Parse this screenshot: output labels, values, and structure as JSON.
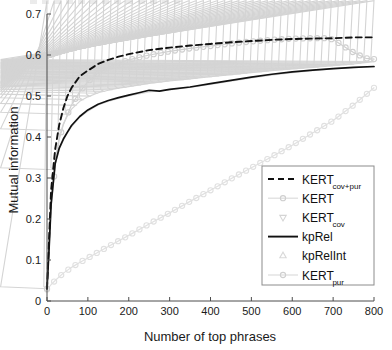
{
  "chart_data": {
    "type": "line",
    "title": "",
    "xlabel": "Number of top phrases",
    "ylabel": "Mutual information",
    "xlim": [
      0,
      800
    ],
    "ylim": [
      0,
      0.7
    ],
    "xticks": [
      0,
      100,
      200,
      300,
      400,
      500,
      600,
      700,
      800
    ],
    "yticks": [
      0,
      0.1,
      0.2,
      0.3,
      0.4,
      0.5,
      0.6,
      0.7
    ],
    "xtick_labels": [
      "0",
      "100",
      "200",
      "300",
      "400",
      "500",
      "600",
      "700",
      "800"
    ],
    "ytick_labels": [
      "0",
      "0.1",
      "0.2",
      "0.3",
      "0.4",
      "0.5",
      "0.6",
      "0.7"
    ],
    "grid": false,
    "legend_position": "lower right",
    "series": [
      {
        "name": "KERT_cov+pur",
        "label_base": "KERT",
        "label_sub": "cov+pur",
        "style": "dashed",
        "marker": "none",
        "color": "#111111",
        "x": [
          0,
          5,
          10,
          20,
          30,
          40,
          50,
          60,
          80,
          100,
          125,
          150,
          175,
          200,
          250,
          300,
          350,
          400,
          450,
          500,
          550,
          600,
          650,
          700,
          750,
          800
        ],
        "y": [
          0.03,
          0.15,
          0.27,
          0.37,
          0.43,
          0.47,
          0.5,
          0.52,
          0.548,
          0.562,
          0.578,
          0.588,
          0.596,
          0.602,
          0.612,
          0.618,
          0.623,
          0.627,
          0.631,
          0.634,
          0.637,
          0.639,
          0.64,
          0.641,
          0.643,
          0.643
        ]
      },
      {
        "name": "KERT",
        "label_base": "KERT",
        "label_sub": "",
        "style": "solid",
        "marker": "circle",
        "color": "#cfcfcf",
        "x": [
          0,
          5,
          10,
          20,
          30,
          40,
          50,
          60,
          80,
          100,
          125,
          150,
          175,
          200,
          250,
          300,
          350,
          400,
          450,
          500,
          550,
          600,
          650,
          680,
          700,
          720,
          750,
          780,
          800
        ],
        "y": [
          0.03,
          0.12,
          0.23,
          0.33,
          0.395,
          0.43,
          0.455,
          0.478,
          0.51,
          0.535,
          0.556,
          0.57,
          0.58,
          0.588,
          0.6,
          0.609,
          0.616,
          0.622,
          0.628,
          0.633,
          0.637,
          0.64,
          0.641,
          0.641,
          0.638,
          0.625,
          0.606,
          0.592,
          0.59
        ]
      },
      {
        "name": "KERT_cov",
        "label_base": "KERT",
        "label_sub": "cov",
        "style": "solid",
        "marker": "triangle-down",
        "color": "#d4d4d4",
        "x": [
          0,
          5,
          10,
          20,
          30,
          40,
          50,
          60,
          80,
          100,
          125,
          150,
          175,
          200,
          250,
          300,
          350,
          400,
          450,
          500,
          550,
          600,
          650,
          700,
          750,
          800
        ],
        "y": [
          0.03,
          0.14,
          0.25,
          0.345,
          0.4,
          0.432,
          0.452,
          0.468,
          0.487,
          0.498,
          0.508,
          0.514,
          0.519,
          0.523,
          0.531,
          0.537,
          0.542,
          0.547,
          0.552,
          0.557,
          0.562,
          0.566,
          0.57,
          0.574,
          0.578,
          0.584
        ]
      },
      {
        "name": "kpRel",
        "label_base": "kpRel",
        "label_sub": "",
        "style": "solid",
        "marker": "none",
        "color": "#111111",
        "x": [
          0,
          5,
          10,
          20,
          30,
          40,
          50,
          60,
          80,
          100,
          125,
          150,
          175,
          200,
          225,
          250,
          275,
          300,
          350,
          400,
          450,
          500,
          550,
          600,
          650,
          700,
          750,
          800
        ],
        "y": [
          0.03,
          0.125,
          0.235,
          0.335,
          0.373,
          0.395,
          0.412,
          0.428,
          0.45,
          0.466,
          0.48,
          0.489,
          0.496,
          0.502,
          0.508,
          0.514,
          0.512,
          0.516,
          0.522,
          0.53,
          0.538,
          0.546,
          0.553,
          0.559,
          0.563,
          0.567,
          0.57,
          0.572
        ]
      },
      {
        "name": "kpRelInt",
        "label_base": "kpRelInt",
        "label_sub": "",
        "style": "solid",
        "marker": "triangle-up",
        "color": "#d9d9d9",
        "x": [
          0,
          5,
          10,
          20,
          30,
          40,
          50,
          60,
          80,
          100,
          125,
          150,
          175,
          200,
          250,
          300,
          350,
          400,
          450,
          500,
          550,
          600,
          650,
          700,
          750,
          800
        ],
        "y": [
          0.03,
          0.125,
          0.235,
          0.333,
          0.37,
          0.392,
          0.41,
          0.425,
          0.448,
          0.463,
          0.478,
          0.487,
          0.494,
          0.5,
          0.51,
          0.515,
          0.521,
          0.528,
          0.536,
          0.544,
          0.551,
          0.557,
          0.562,
          0.566,
          0.569,
          0.571
        ]
      },
      {
        "name": "KERT_pur",
        "label_base": "KERT",
        "label_sub": "pur",
        "style": "solid",
        "marker": "circle",
        "color": "#e0e0e0",
        "x": [
          0,
          10,
          20,
          40,
          60,
          80,
          100,
          150,
          200,
          250,
          300,
          350,
          400,
          450,
          500,
          550,
          600,
          650,
          700,
          750,
          800
        ],
        "y": [
          0.028,
          0.04,
          0.05,
          0.068,
          0.082,
          0.094,
          0.105,
          0.133,
          0.16,
          0.188,
          0.215,
          0.243,
          0.27,
          0.298,
          0.325,
          0.352,
          0.38,
          0.41,
          0.44,
          0.478,
          0.52
        ]
      }
    ]
  },
  "axes": {
    "ylabel": "Mutual information",
    "xlabel": "Number of top phrases"
  },
  "legend": {
    "items": [
      {
        "base": "KERT",
        "sub": "cov+pur",
        "sample": "dashed-line"
      },
      {
        "base": "KERT",
        "sub": "",
        "sample": "circle-line"
      },
      {
        "base": "KERT",
        "sub": "cov",
        "sample": "triangle-down-line"
      },
      {
        "base": "kpRel",
        "sub": "",
        "sample": "solid-line"
      },
      {
        "base": "kpRelInt",
        "sub": "",
        "sample": "triangle-up-line"
      },
      {
        "base": "KERT",
        "sub": "pur",
        "sample": "circle-line"
      }
    ]
  },
  "colors": {
    "axis": "#4d4d4d",
    "text": "#1a1a1a",
    "dark_series": "#111111",
    "light_series": "#d4d4d4",
    "legend_border": "#8c8c8c",
    "background": "#ffffff"
  }
}
